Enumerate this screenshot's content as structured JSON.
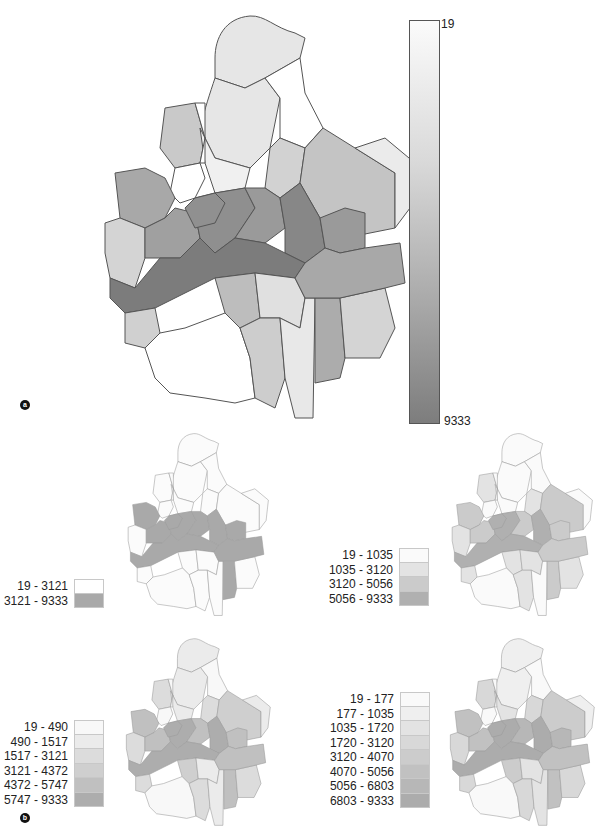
{
  "figure": {
    "panel_a": {
      "marker": "a",
      "colorbar": {
        "min_label": "19",
        "max_label": "9333",
        "min_color": "#fbfbfb",
        "max_color": "#7d7d7d"
      },
      "district_fills": [
        "#e6e6e6",
        "#e6e6e6",
        "#ffffff",
        "#c9c9c9",
        "#f0f0f0",
        "#ffffff",
        "#d2d2d2",
        "#ffffff",
        "#c4c4c4",
        "#a8a8a8",
        "#d4d4d4",
        "#a0a0a0",
        "#8f8f8f",
        "#9a9a9a",
        "#878787",
        "#9a9a9a",
        "#7c7c7c",
        "#d0d0d0",
        "#bdbdbd",
        "#e0e0e0",
        "#ffffff",
        "#cdcdcd",
        "#e8e8e8",
        "#acacac",
        "#d4d4d4",
        "#a8a8a8",
        "#ebebeb",
        "#909090"
      ]
    },
    "panel_b": {
      "marker": "b",
      "maps": [
        {
          "id": "two-class",
          "legend": [
            {
              "label": "19 - 3121",
              "color": "#ffffff"
            },
            {
              "label": "3121 - 9333",
              "color": "#a9a9a9"
            }
          ],
          "district_fills": [
            "#fbfbfb",
            "#fbfbfb",
            "#fbfbfb",
            "#fbfbfb",
            "#fbfbfb",
            "#fbfbfb",
            "#fbfbfb",
            "#fbfbfb",
            "#fbfbfb",
            "#a9a9a9",
            "#fbfbfb",
            "#a9a9a9",
            "#a9a9a9",
            "#a9a9a9",
            "#a9a9a9",
            "#a9a9a9",
            "#a9a9a9",
            "#fbfbfb",
            "#fbfbfb",
            "#fbfbfb",
            "#fbfbfb",
            "#fbfbfb",
            "#fbfbfb",
            "#a9a9a9",
            "#fbfbfb",
            "#a9a9a9",
            "#fbfbfb",
            "#a9a9a9"
          ]
        },
        {
          "id": "four-class",
          "legend": [
            {
              "label": "19 - 1035",
              "color": "#fafafa"
            },
            {
              "label": "1035 - 3120",
              "color": "#e3e3e3"
            },
            {
              "label": "3120 - 5056",
              "color": "#cbcbcb"
            },
            {
              "label": "5056 - 9333",
              "color": "#b0b0b0"
            }
          ],
          "district_fills": [
            "#fafafa",
            "#fafafa",
            "#fafafa",
            "#e3e3e3",
            "#fafafa",
            "#fafafa",
            "#e3e3e3",
            "#fafafa",
            "#cbcbcb",
            "#cbcbcb",
            "#e3e3e3",
            "#cbcbcb",
            "#b0b0b0",
            "#cbcbcb",
            "#b0b0b0",
            "#cbcbcb",
            "#b0b0b0",
            "#e3e3e3",
            "#e3e3e3",
            "#e3e3e3",
            "#fafafa",
            "#e3e3e3",
            "#fafafa",
            "#cbcbcb",
            "#e3e3e3",
            "#cbcbcb",
            "#fafafa",
            "#b0b0b0"
          ]
        },
        {
          "id": "six-class",
          "legend": [
            {
              "label": "19 - 490",
              "color": "#f8f8f8"
            },
            {
              "label": "490 - 1517",
              "color": "#ebebeb"
            },
            {
              "label": "1517 - 3121",
              "color": "#dcdcdc"
            },
            {
              "label": "3121 - 4372",
              "color": "#cfcfcf"
            },
            {
              "label": "4372 - 5747",
              "color": "#c0c0c0"
            },
            {
              "label": "5747 - 9333",
              "color": "#adadad"
            }
          ],
          "district_fills": [
            "#ebebeb",
            "#ebebeb",
            "#f8f8f8",
            "#dcdcdc",
            "#ebebeb",
            "#f8f8f8",
            "#dcdcdc",
            "#f8f8f8",
            "#cfcfcf",
            "#c0c0c0",
            "#dcdcdc",
            "#c0c0c0",
            "#adadad",
            "#c0c0c0",
            "#adadad",
            "#c0c0c0",
            "#adadad",
            "#dcdcdc",
            "#cfcfcf",
            "#ebebeb",
            "#f8f8f8",
            "#dcdcdc",
            "#ebebeb",
            "#c0c0c0",
            "#dcdcdc",
            "#c0c0c0",
            "#ebebeb",
            "#adadad"
          ]
        },
        {
          "id": "eight-class",
          "legend": [
            {
              "label": "19 - 177",
              "color": "#f9f9f9"
            },
            {
              "label": "177 - 1035",
              "color": "#efefef"
            },
            {
              "label": "1035 - 1720",
              "color": "#e3e3e3"
            },
            {
              "label": "1720 - 3120",
              "color": "#d8d8d8"
            },
            {
              "label": "3120 - 4070",
              "color": "#cccccc"
            },
            {
              "label": "4070 - 5056",
              "color": "#c1c1c1"
            },
            {
              "label": "5056 - 6803",
              "color": "#b7b7b7"
            },
            {
              "label": "6803 - 9333",
              "color": "#acacac"
            }
          ],
          "district_fills": [
            "#efefef",
            "#efefef",
            "#f9f9f9",
            "#d8d8d8",
            "#e3e3e3",
            "#f9f9f9",
            "#d8d8d8",
            "#f9f9f9",
            "#cccccc",
            "#c1c1c1",
            "#d8d8d8",
            "#c1c1c1",
            "#acacac",
            "#b7b7b7",
            "#acacac",
            "#b7b7b7",
            "#acacac",
            "#d8d8d8",
            "#cccccc",
            "#e3e3e3",
            "#f9f9f9",
            "#d8d8d8",
            "#e3e3e3",
            "#c1c1c1",
            "#d8d8d8",
            "#c1c1c1",
            "#efefef",
            "#acacac"
          ]
        }
      ]
    }
  }
}
